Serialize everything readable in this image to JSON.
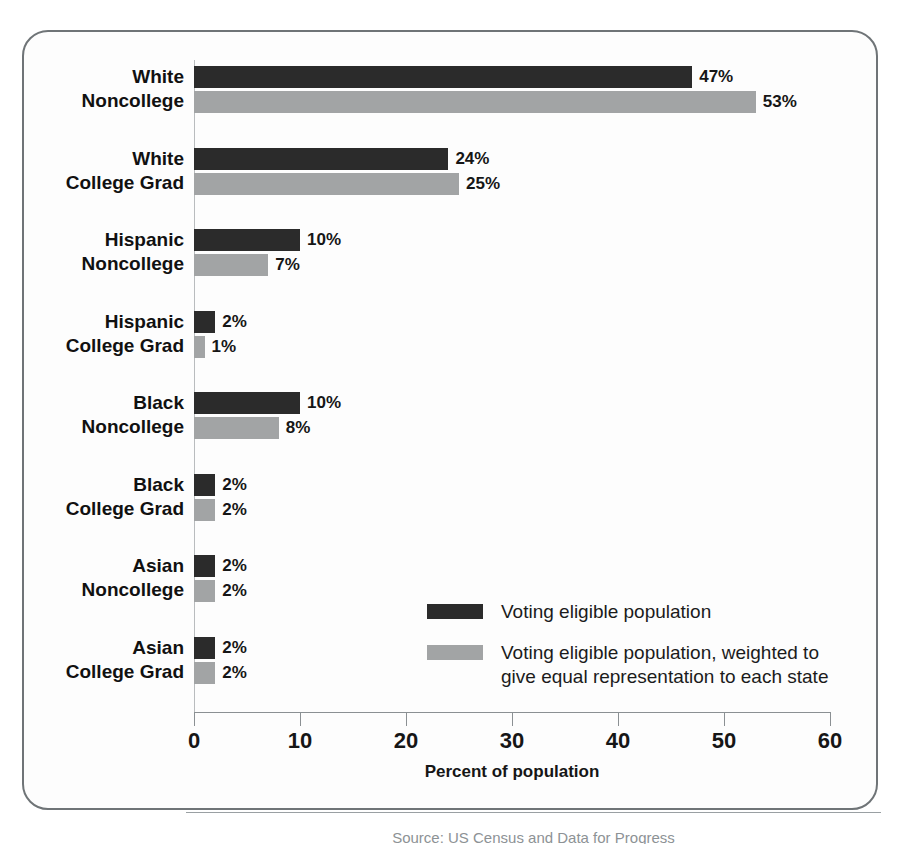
{
  "chart_data": {
    "type": "bar",
    "orientation": "horizontal",
    "title": "",
    "xlabel": "Percent of population",
    "ylabel": "",
    "xlim": [
      0,
      60
    ],
    "xticks": [
      0,
      10,
      20,
      30,
      40,
      50,
      60
    ],
    "xtick_labels": [
      "0",
      "10",
      "20",
      "30",
      "40",
      "50",
      "60"
    ],
    "grid": false,
    "legend_position": "inside-lower-right",
    "categories": [
      "White Noncollege",
      "White College Grad",
      "Hispanic Noncollege",
      "Hispanic College Grad",
      "Black Noncollege",
      "Black College Grad",
      "Asian Noncollege",
      "Asian College Grad"
    ],
    "category_lines": [
      [
        "White",
        "Noncollege"
      ],
      [
        "White",
        "College Grad"
      ],
      [
        "Hispanic",
        "Noncollege"
      ],
      [
        "Hispanic",
        "College Grad"
      ],
      [
        "Black",
        "Noncollege"
      ],
      [
        "Black",
        "College Grad"
      ],
      [
        "Asian",
        "Noncollege"
      ],
      [
        "Asian",
        "College Grad"
      ]
    ],
    "series": [
      {
        "name": "Voting eligible population",
        "color": "#2b2b2b",
        "values": [
          47,
          24,
          10,
          2,
          10,
          2,
          2,
          2
        ],
        "labels": [
          "47%",
          "24%",
          "10%",
          "2%",
          "10%",
          "2%",
          "2%",
          "2%"
        ]
      },
      {
        "name": "Voting eligible population, weighted to give equal representation to each state",
        "color": "#a2a4a5",
        "values": [
          53,
          25,
          7,
          1,
          8,
          2,
          2,
          2
        ],
        "labels": [
          "53%",
          "25%",
          "7%",
          "1%",
          "8%",
          "2%",
          "2%",
          "2%"
        ]
      }
    ],
    "legend": [
      {
        "swatch": "#2b2b2b",
        "lines": [
          "Voting eligible population"
        ]
      },
      {
        "swatch": "#a2a4a5",
        "lines": [
          "Voting eligible population, weighted to",
          "give equal representation to each state"
        ]
      }
    ]
  },
  "footer": {
    "source": "Source: US Census and Data for Progress"
  }
}
